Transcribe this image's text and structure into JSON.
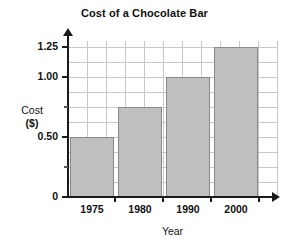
{
  "chart_data": {
    "type": "bar",
    "title": "Cost of a Chocolate Bar",
    "xlabel": "Year",
    "ylabel": "Cost",
    "ylabel_units": "($)",
    "categories": [
      "1975",
      "1980",
      "1990",
      "2000"
    ],
    "values": [
      0.5,
      0.75,
      1.0,
      1.25
    ],
    "ylim": [
      0,
      1.3
    ],
    "y_major_ticks": [
      0,
      0.5,
      1.0,
      1.25
    ],
    "y_major_tick_labels": [
      "0",
      "0.50",
      "1.00",
      "1.25"
    ],
    "y_minor_ticks": [
      0.25,
      0.75
    ],
    "y_gridline_step": 0.125,
    "grid": true,
    "legend": "none",
    "bar_color": "#bfbfbf",
    "bar_border_color": "#8a8a8a",
    "grid_color": "#c8c8c8",
    "axis_color": "#1a1a1a"
  },
  "axis": {
    "y_labels": [
      {
        "text": "1.25",
        "value": 1.25
      },
      {
        "text": "1.00",
        "value": 1.0
      },
      {
        "text": "0.50",
        "value": 0.5
      },
      {
        "text": "0",
        "value": 0
      }
    ],
    "x_labels": [
      "1975",
      "1980",
      "1990",
      "2000"
    ]
  }
}
